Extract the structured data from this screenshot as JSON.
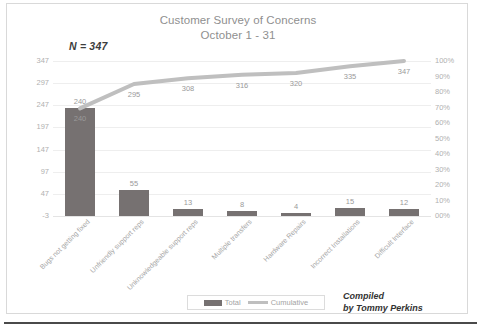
{
  "chart_data": {
    "type": "bar",
    "title": "Customer Survey of Concerns",
    "subtitle": "October 1 - 31",
    "annotation": "N = 347",
    "xlabel": "",
    "ylabel": "",
    "categories": [
      "Bugs not getting fixed",
      "Unfriendly support reps",
      "Unknowledgeable support reps",
      "Multiple transfers",
      "Hardware Repairs",
      "Incorrect Installations",
      "Difficult Interface"
    ],
    "series": [
      {
        "name": "Total",
        "type": "bar",
        "color": "#767171",
        "values": [
          240,
          55,
          13,
          8,
          4,
          15,
          12
        ],
        "labels": [
          "240",
          "55",
          "13",
          "8",
          "4",
          "15",
          "12"
        ]
      },
      {
        "name": "Cumulative",
        "type": "line",
        "color": "#BFBFBF",
        "values": [
          240,
          295,
          308,
          316,
          320,
          335,
          347
        ],
        "labels": [
          "240",
          "295",
          "308",
          "316",
          "320",
          "335",
          "347"
        ],
        "axis": "right"
      }
    ],
    "ylim": [
      -3,
      347
    ],
    "ytick_labels": [
      "347",
      "297",
      "247",
      "197",
      "147",
      "97",
      "47",
      "-3"
    ],
    "y2lim": [
      0,
      100
    ],
    "y2tick_labels": [
      "100%",
      "90%",
      "80%",
      "70%",
      "60%",
      "50%",
      "40%",
      "30%",
      "20%",
      "10%",
      "00%"
    ],
    "grid": true,
    "legend_position": "bottom",
    "legend_entries": [
      "Total",
      "Cumulative"
    ]
  },
  "attribution": {
    "line1": "Compiled",
    "line2": "by Tommy Perkins"
  }
}
